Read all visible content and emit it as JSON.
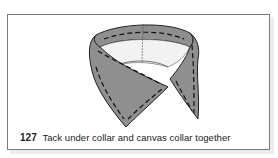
{
  "figure": {
    "number": "127",
    "caption": "Tack under collar and canvas collar together",
    "illustration": "collar-tacking-illustration",
    "colors": {
      "collar_fill": "#8f8f8f",
      "canvas_fill": "#f2f2f2",
      "outline": "#222222",
      "frame_border": "#7a7a7a"
    }
  }
}
